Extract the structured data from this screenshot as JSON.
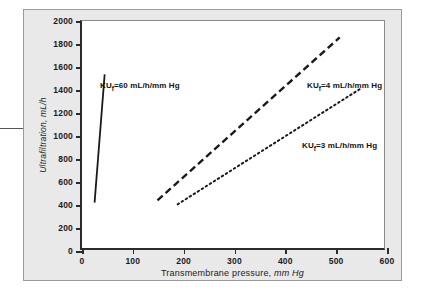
{
  "chart_data": {
    "type": "line",
    "title": "",
    "xlabel": "Transmembrane pressure, mm Hg",
    "xlabel_plain": "Transmembrane pressure,",
    "xlabel_unit": "mm Hg",
    "ylabel": "Ultrafiltration, mL/h",
    "xlim": [
      0,
      600
    ],
    "ylim": [
      0,
      2000
    ],
    "xticks": [
      0,
      100,
      200,
      300,
      400,
      500,
      600
    ],
    "yticks": [
      0,
      200,
      400,
      600,
      800,
      1000,
      1200,
      1400,
      1600,
      1800,
      2000
    ],
    "grid": false,
    "legend": "inline-annotations",
    "series": [
      {
        "name": "KUf=60 mL/h/mm Hg",
        "label_prefix": "KU",
        "label_sub": "f",
        "label_suffix": "=60 mL/h/mm Hg",
        "kuf": 60,
        "style": "solid",
        "color": "#1a1a1a",
        "points": [
          [
            25,
            400
          ],
          [
            45,
            1530
          ]
        ],
        "annotation_x": 98,
        "annotation_y": 80
      },
      {
        "name": "KUf=4 mL/h/mm Hg",
        "label_prefix": "KU",
        "label_sub": "f",
        "label_suffix": "=4 mL/h/mm Hg",
        "kuf": 4,
        "style": "dashed",
        "color": "#1a1a1a",
        "points": [
          [
            150,
            420
          ],
          [
            512,
            1855
          ]
        ],
        "annotation_x": 305,
        "annotation_y": 80
      },
      {
        "name": "KUf=3 mL/h/mm Hg",
        "label_prefix": "KU",
        "label_sub": "f",
        "label_suffix": "=3 mL/h/mm Hg",
        "kuf": 3,
        "style": "dotted",
        "color": "#1a1a1a",
        "points": [
          [
            190,
            385
          ],
          [
            552,
            1400
          ]
        ],
        "annotation_x": 300,
        "annotation_y": 140
      }
    ]
  }
}
